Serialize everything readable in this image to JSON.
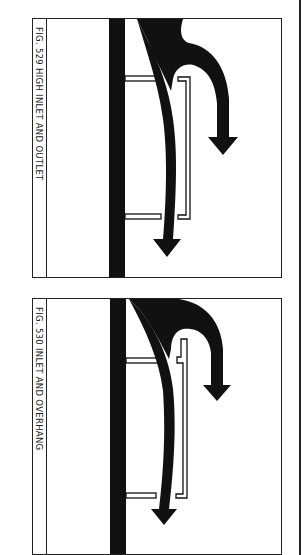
{
  "figures": [
    {
      "number": "529",
      "caption": "FIG. 529  HIGH INLET AND OUTLET",
      "elements": [
        "wall",
        "upper-fin",
        "lower-fin",
        "vented-panel",
        "inlet-airflow-arrow",
        "outlet-airflow-arrow"
      ]
    },
    {
      "number": "530",
      "caption": "FIG. 530  INLET AND OVERHANG",
      "elements": [
        "wall",
        "upper-fin",
        "lower-fin",
        "stepped-panel",
        "inlet-airflow-arrow",
        "outlet-airflow-arrow"
      ]
    }
  ],
  "colors": {
    "ink": "#111111",
    "paper": "#ffffff",
    "frame": "#222222"
  }
}
